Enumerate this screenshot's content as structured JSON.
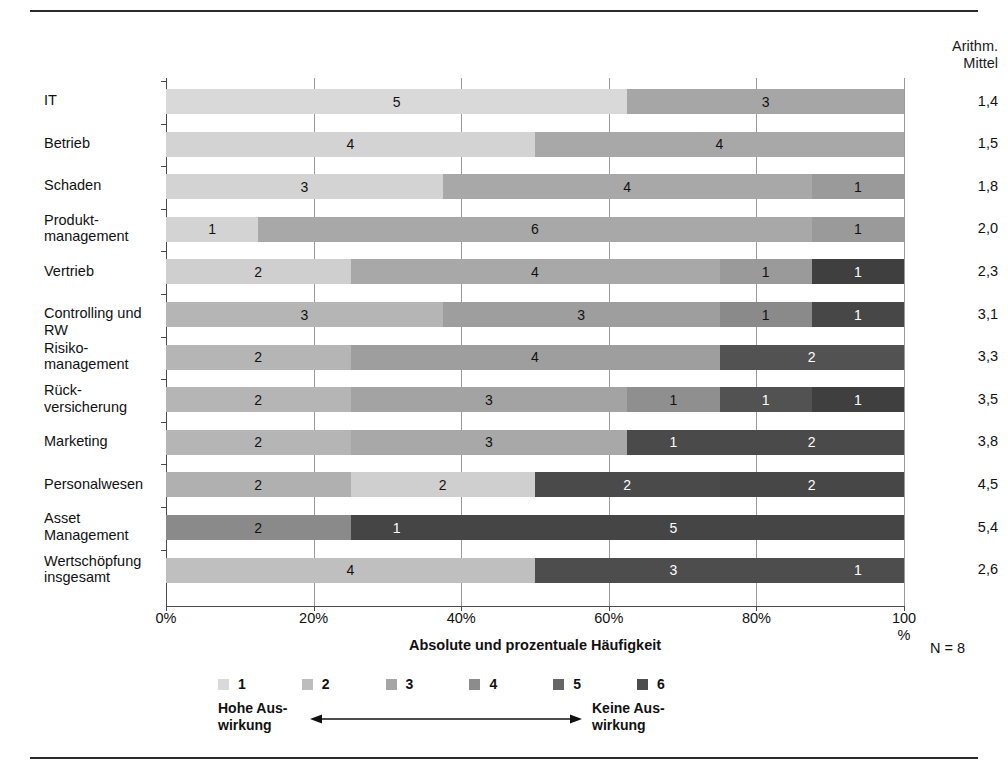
{
  "header": {
    "mean_column_line1": "Arithm.",
    "mean_column_line2": "Mittel"
  },
  "axis": {
    "xlabel": "Absolute und prozentuale Häufigkeit",
    "ticks": [
      "0%",
      "20%",
      "40%",
      "60%",
      "80%"
    ],
    "tick_last_line1": "100",
    "tick_last_line2": "%",
    "n_label": "N = 8"
  },
  "legend": {
    "items": [
      {
        "label": "1",
        "color": "#d9d9d9"
      },
      {
        "label": "2",
        "color": "#bdbdbd"
      },
      {
        "label": "3",
        "color": "#a6a6a6"
      },
      {
        "label": "4",
        "color": "#8c8c8c"
      },
      {
        "label": "5",
        "color": "#666666"
      },
      {
        "label": "6",
        "color": "#4d4d4d"
      }
    ],
    "anchor_low": "Hohe Aus-\nwirkung",
    "anchor_high": "Keine Aus-\nwirkung"
  },
  "chart_data": {
    "type": "bar",
    "orientation": "horizontal",
    "stacked": true,
    "title": "",
    "xlabel": "Absolute und prozentuale Häufigkeit",
    "ylabel": "",
    "xlim": [
      0,
      100
    ],
    "xticks": [
      0,
      20,
      40,
      60,
      80,
      100
    ],
    "grid": true,
    "legend_position": "bottom",
    "n": 8,
    "scale_levels": [
      1,
      2,
      3,
      4,
      5,
      6
    ],
    "scale_level_colors": [
      "#d9d9d9",
      "#bdbdbd",
      "#a6a6a6",
      "#8c8c8c",
      "#666666",
      "#4d4d4d"
    ],
    "value_unit": "count_of_8",
    "categories": [
      "IT",
      "Betrieb",
      "Schaden",
      "Produkt-\nmanagement",
      "Vertrieb",
      "Controlling und RW",
      "Risiko-\nmanagement",
      "Rück-\nversicherung",
      "Marketing",
      "Personalwesen",
      "Asset\nManagement",
      "Wertschöpfung\ninsgesamt"
    ],
    "rows": [
      {
        "category": "IT",
        "mean": "1,4",
        "segments": [
          {
            "level": 1,
            "count": 5,
            "percent": 62.5,
            "color": "#d9d9d9",
            "label": "5",
            "label_color": "#111111"
          },
          {
            "level": 3,
            "count": 3,
            "percent": 37.5,
            "color": "#a6a6a6",
            "label": "3",
            "label_color": "#111111"
          }
        ]
      },
      {
        "category": "Betrieb",
        "mean": "1,5",
        "segments": [
          {
            "level": 1,
            "count": 4,
            "percent": 50.0,
            "color": "#d3d3d3",
            "label": "4",
            "label_color": "#111111"
          },
          {
            "level": 2,
            "count": 4,
            "percent": 50.0,
            "color": "#a8a8a8",
            "label": "4",
            "label_color": "#111111"
          }
        ]
      },
      {
        "category": "Schaden",
        "mean": "1,8",
        "segments": [
          {
            "level": 1,
            "count": 3,
            "percent": 37.5,
            "color": "#d3d3d3",
            "label": "3",
            "label_color": "#111111"
          },
          {
            "level": 2,
            "count": 4,
            "percent": 50.0,
            "color": "#a8a8a8",
            "label": "4",
            "label_color": "#111111"
          },
          {
            "level": 3,
            "count": 1,
            "percent": 12.5,
            "color": "#9a9a9a",
            "label": "1",
            "label_color": "#111111"
          }
        ]
      },
      {
        "category": "Produkt-\nmanagement",
        "mean": "2,0",
        "segments": [
          {
            "level": 1,
            "count": 1,
            "percent": 12.5,
            "color": "#d3d3d3",
            "label": "1",
            "label_color": "#111111"
          },
          {
            "level": 2,
            "count": 6,
            "percent": 75.0,
            "color": "#a8a8a8",
            "label": "6",
            "label_color": "#111111"
          },
          {
            "level": 3,
            "count": 1,
            "percent": 12.5,
            "color": "#9a9a9a",
            "label": "1",
            "label_color": "#111111"
          }
        ]
      },
      {
        "category": "Vertrieb",
        "mean": "2,3",
        "segments": [
          {
            "level": 1,
            "count": 2,
            "percent": 25.0,
            "color": "#cfcfcf",
            "label": "2",
            "label_color": "#111111"
          },
          {
            "level": 2,
            "count": 4,
            "percent": 50.0,
            "color": "#a8a8a8",
            "label": "4",
            "label_color": "#111111"
          },
          {
            "level": 3,
            "count": 1,
            "percent": 12.5,
            "color": "#9a9a9a",
            "label": "1",
            "label_color": "#111111"
          },
          {
            "level": 6,
            "count": 1,
            "percent": 12.5,
            "color": "#3f3f3f",
            "label": "1",
            "label_color": "#ffffff"
          }
        ]
      },
      {
        "category": "Controlling und RW",
        "mean": "3,1",
        "segments": [
          {
            "level": 2,
            "count": 3,
            "percent": 37.5,
            "color": "#b5b5b5",
            "label": "3",
            "label_color": "#111111"
          },
          {
            "level": 3,
            "count": 3,
            "percent": 37.5,
            "color": "#9e9e9e",
            "label": "3",
            "label_color": "#111111"
          },
          {
            "level": 4,
            "count": 1,
            "percent": 12.5,
            "color": "#8a8a8a",
            "label": "1",
            "label_color": "#111111"
          },
          {
            "level": 6,
            "count": 1,
            "percent": 12.5,
            "color": "#474747",
            "label": "1",
            "label_color": "#ffffff"
          }
        ]
      },
      {
        "category": "Risiko-\nmanagement",
        "mean": "3,3",
        "segments": [
          {
            "level": 2,
            "count": 2,
            "percent": 25.0,
            "color": "#b5b5b5",
            "label": "2",
            "label_color": "#111111"
          },
          {
            "level": 3,
            "count": 4,
            "percent": 50.0,
            "color": "#9e9e9e",
            "label": "4",
            "label_color": "#111111"
          },
          {
            "level": 5,
            "count": 2,
            "percent": 25.0,
            "color": "#525252",
            "label": "2",
            "label_color": "#ffffff"
          }
        ]
      },
      {
        "category": "Rück-\nversicherung",
        "mean": "3,5",
        "segments": [
          {
            "level": 2,
            "count": 2,
            "percent": 25.0,
            "color": "#b5b5b5",
            "label": "2",
            "label_color": "#111111"
          },
          {
            "level": 3,
            "count": 3,
            "percent": 37.5,
            "color": "#a3a3a3",
            "label": "3",
            "label_color": "#111111"
          },
          {
            "level": 4,
            "count": 1,
            "percent": 12.5,
            "color": "#8f8f8f",
            "label": "1",
            "label_color": "#111111"
          },
          {
            "level": 5,
            "count": 1,
            "percent": 12.5,
            "color": "#525252",
            "label": "1",
            "label_color": "#ffffff"
          },
          {
            "level": 6,
            "count": 1,
            "percent": 12.5,
            "color": "#3f3f3f",
            "label": "1",
            "label_color": "#ffffff"
          }
        ]
      },
      {
        "category": "Marketing",
        "mean": "3,8",
        "segments": [
          {
            "level": 2,
            "count": 2,
            "percent": 25.0,
            "color": "#b5b5b5",
            "label": "2",
            "label_color": "#111111"
          },
          {
            "level": 3,
            "count": 3,
            "percent": 37.5,
            "color": "#a8a8a8",
            "label": "3",
            "label_color": "#111111"
          },
          {
            "level": 5,
            "count": 1,
            "percent": 12.5,
            "color": "#4a4a4a",
            "label": "1",
            "label_color": "#ffffff"
          },
          {
            "level": 5,
            "count": 2,
            "percent": 25.0,
            "color": "#4a4a4a",
            "label": "2",
            "label_color": "#ffffff"
          }
        ]
      },
      {
        "category": "Personalwesen",
        "mean": "4,5",
        "segments": [
          {
            "level": 2,
            "count": 2,
            "percent": 25.0,
            "color": "#b0b0b0",
            "label": "2",
            "label_color": "#111111"
          },
          {
            "level": 1,
            "count": 2,
            "percent": 25.0,
            "color": "#cfcfcf",
            "label": "2",
            "label_color": "#111111"
          },
          {
            "level": 5,
            "count": 2,
            "percent": 25.0,
            "color": "#4a4a4a",
            "label": "2",
            "label_color": "#ffffff"
          },
          {
            "level": 5,
            "count": 2,
            "percent": 25.0,
            "color": "#474747",
            "label": "2",
            "label_color": "#ffffff"
          }
        ]
      },
      {
        "category": "Asset\nManagement",
        "mean": "5,4",
        "segments": [
          {
            "level": 4,
            "count": 2,
            "percent": 25.0,
            "color": "#8a8a8a",
            "label": "2",
            "label_color": "#111111"
          },
          {
            "level": 6,
            "count": 1,
            "percent": 12.5,
            "color": "#454545",
            "label": "1",
            "label_color": "#ffffff"
          },
          {
            "level": 6,
            "count": 5,
            "percent": 62.5,
            "color": "#454545",
            "label": "5",
            "label_color": "#ffffff"
          }
        ]
      },
      {
        "category": "Wertschöpfung\ninsgesamt",
        "mean": "2,6",
        "segments": [
          {
            "level": 2,
            "count": 4,
            "percent": 50.0,
            "color": "#bfbfbf",
            "label": "4",
            "label_color": "#111111"
          },
          {
            "level": 5,
            "count": 3,
            "percent": 37.5,
            "color": "#4d4d4d",
            "label": "3",
            "label_color": "#ffffff"
          },
          {
            "level": 5,
            "count": 1,
            "percent": 12.5,
            "color": "#4d4d4d",
            "label": "1",
            "label_color": "#ffffff"
          }
        ]
      }
    ]
  }
}
